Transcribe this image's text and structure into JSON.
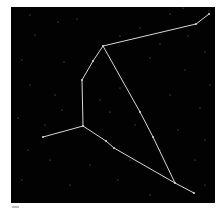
{
  "image": {
    "subject": "constellation star chart",
    "background_color": "#020202",
    "line_color": "#d8d8d8",
    "star_color": "#cfcfcf"
  },
  "constellation": {
    "lines": [
      [
        [
          209,
          14
        ],
        [
          196,
          24
        ],
        [
          103,
          46
        ],
        [
          93,
          61
        ],
        [
          82,
          80
        ],
        [
          83,
          126
        ],
        [
          43,
          137
        ]
      ],
      [
        [
          83,
          126
        ],
        [
          106,
          141
        ],
        [
          114,
          148
        ],
        [
          175,
          183
        ],
        [
          194,
          193
        ]
      ],
      [
        [
          103,
          46
        ],
        [
          140,
          112
        ],
        [
          153,
          137
        ],
        [
          175,
          183
        ]
      ]
    ],
    "vertices": [
      [
        209,
        14
      ],
      [
        196,
        24
      ],
      [
        103,
        46
      ],
      [
        93,
        61
      ],
      [
        82,
        80
      ],
      [
        83,
        126
      ],
      [
        43,
        137
      ],
      [
        106,
        141
      ],
      [
        114,
        148
      ],
      [
        175,
        183
      ],
      [
        194,
        193
      ],
      [
        140,
        112
      ],
      [
        153,
        137
      ]
    ]
  },
  "background_stars": [
    [
      30,
      15
    ],
    [
      58,
      22
    ],
    [
      77,
      19
    ],
    [
      140,
      28
    ],
    [
      170,
      14
    ],
    [
      183,
      8
    ],
    [
      35,
      35
    ],
    [
      120,
      36
    ],
    [
      160,
      44
    ],
    [
      205,
      52
    ],
    [
      22,
      60
    ],
    [
      64,
      62
    ],
    [
      150,
      58
    ],
    [
      185,
      70
    ],
    [
      210,
      85
    ],
    [
      30,
      85
    ],
    [
      55,
      95
    ],
    [
      120,
      88
    ],
    [
      170,
      95
    ],
    [
      200,
      108
    ],
    [
      18,
      118
    ],
    [
      62,
      110
    ],
    [
      110,
      112
    ],
    [
      135,
      125
    ],
    [
      178,
      130
    ],
    [
      205,
      140
    ],
    [
      28,
      150
    ],
    [
      50,
      160
    ],
    [
      90,
      165
    ],
    [
      130,
      160
    ],
    [
      160,
      150
    ],
    [
      195,
      160
    ],
    [
      22,
      180
    ],
    [
      70,
      185
    ],
    [
      118,
      180
    ],
    [
      150,
      195
    ],
    [
      205,
      185
    ],
    [
      45,
      125
    ],
    [
      100,
      100
    ],
    [
      188,
      36
    ]
  ]
}
